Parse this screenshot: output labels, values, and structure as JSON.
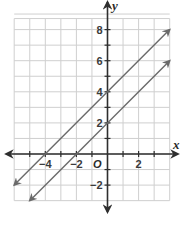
{
  "chart_data": {
    "type": "line",
    "title": "",
    "xlabel": "x",
    "ylabel": "y",
    "origin_label": "O",
    "xlim": [
      -6,
      4
    ],
    "ylim": [
      -3,
      9
    ],
    "grid": true,
    "x_tick_labels": [
      {
        "value": -4,
        "label": "−4"
      },
      {
        "value": -2,
        "label": "−2"
      },
      {
        "value": 2,
        "label": "2"
      }
    ],
    "y_tick_labels": [
      {
        "value": 8,
        "label": "8"
      },
      {
        "value": 6,
        "label": "6"
      },
      {
        "value": 4,
        "label": "4"
      },
      {
        "value": 2,
        "label": "2"
      },
      {
        "value": -2,
        "label": "−2"
      }
    ],
    "series": [
      {
        "name": "y = x + 4",
        "slope": 1,
        "intercept": 4,
        "x": [
          -6,
          4
        ],
        "y": [
          -2,
          8
        ]
      },
      {
        "name": "y = x + 2",
        "slope": 1,
        "intercept": 2,
        "x": [
          -5,
          4
        ],
        "y": [
          -3,
          6
        ]
      }
    ],
    "colors": {
      "grid": "#cfcfcf",
      "axis": "#2e2e2e",
      "line": "#6a6a6a"
    }
  }
}
